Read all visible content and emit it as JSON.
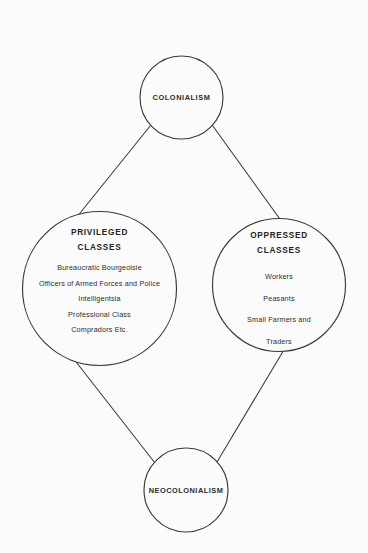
{
  "diagram": {
    "type": "flow-diagram",
    "shape": "diamond",
    "background_color": "#fbfbfb",
    "stroke_color": "#333333",
    "text_color": "#2b2b2b",
    "nodes": {
      "top": {
        "id": "colonialism",
        "label": "COLONIALISM",
        "shape": "circle"
      },
      "left": {
        "id": "privileged-classes",
        "heading_line_1": "PRIVILEGED",
        "heading_line_2": "CLASSES",
        "shape": "circle",
        "members": [
          "Bureaucratic Bourgeoisie",
          "Officers of Armed Forces and Police",
          "Intelligentsia",
          "Professional Class",
          "Compradors Etc."
        ]
      },
      "right": {
        "id": "oppressed-classes",
        "heading_line_1": "OPPRESSED",
        "heading_line_2": "CLASSES",
        "shape": "circle",
        "members": [
          "Workers",
          "Peasants",
          "Small Farmers and",
          "Traders"
        ]
      },
      "bottom": {
        "id": "neocolonialism",
        "label": "NEOCOLONIALISM",
        "shape": "circle"
      }
    },
    "connectors": [
      {
        "id": "colonialism-to-privileged",
        "from": "colonialism",
        "to": "privileged-classes"
      },
      {
        "id": "colonialism-to-oppressed",
        "from": "colonialism",
        "to": "oppressed-classes"
      },
      {
        "id": "privileged-to-neocolonialism",
        "from": "privileged-classes",
        "to": "neocolonialism"
      },
      {
        "id": "oppressed-to-neocolonialism",
        "from": "oppressed-classes",
        "to": "neocolonialism"
      }
    ]
  }
}
